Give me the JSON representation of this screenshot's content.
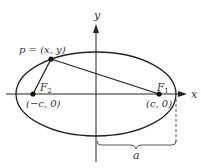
{
  "diagram": {
    "colors": {
      "stroke": "#222222",
      "text": "#333333",
      "background": "#ffffff"
    },
    "axes": {
      "x_label": "x",
      "y_label": "y"
    },
    "ellipse": {
      "cx": 96,
      "cy": 94,
      "rx": 80,
      "ry": 42
    },
    "point_p": {
      "label": "p = (x, y)",
      "cx": 51,
      "cy": 59
    },
    "focus_1": {
      "name": "F",
      "subscript": "1",
      "coords_label": "(c, 0)",
      "cx": 159,
      "cy": 94
    },
    "focus_2": {
      "name": "F",
      "subscript": "2",
      "coords_label": "(−c, 0)",
      "cx": 33,
      "cy": 94
    },
    "semi_major": {
      "label": "a"
    }
  }
}
